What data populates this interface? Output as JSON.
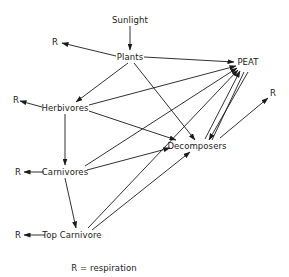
{
  "diagram": {
    "type": "energy-flow",
    "nodes": {
      "sunlight": "Sunlight",
      "plants": "Plants",
      "peat": "PEAT",
      "herbivores": "Herbivores",
      "decomposers": "Decomposers",
      "carnivores": "Carnivores",
      "top_carnivore": "Top Carnivore",
      "r_plants": "R",
      "r_herbivores": "R",
      "r_carnivores": "R",
      "r_top_carnivore": "R",
      "r_decomposers": "R"
    },
    "edges": [
      {
        "from": "Sunlight",
        "to": "Plants"
      },
      {
        "from": "Plants",
        "to": "R"
      },
      {
        "from": "Plants",
        "to": "PEAT"
      },
      {
        "from": "Plants",
        "to": "Herbivores"
      },
      {
        "from": "Plants",
        "to": "Decomposers"
      },
      {
        "from": "Herbivores",
        "to": "R"
      },
      {
        "from": "Herbivores",
        "to": "PEAT"
      },
      {
        "from": "Herbivores",
        "to": "Carnivores"
      },
      {
        "from": "Herbivores",
        "to": "Decomposers"
      },
      {
        "from": "Carnivores",
        "to": "R"
      },
      {
        "from": "Carnivores",
        "to": "PEAT"
      },
      {
        "from": "Carnivores",
        "to": "Decomposers"
      },
      {
        "from": "Carnivores",
        "to": "Top Carnivore"
      },
      {
        "from": "Top Carnivore",
        "to": "R"
      },
      {
        "from": "Top Carnivore",
        "to": "PEAT"
      },
      {
        "from": "Top Carnivore",
        "to": "Decomposers"
      },
      {
        "from": "Decomposers",
        "to": "PEAT"
      },
      {
        "from": "PEAT",
        "to": "Decomposers"
      },
      {
        "from": "Decomposers",
        "to": "R"
      }
    ],
    "legend": "R = respiration"
  }
}
